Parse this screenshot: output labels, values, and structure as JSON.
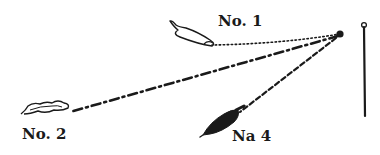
{
  "diagram": {
    "type": "hand-drawn illustration",
    "colors": {
      "ink": "#1a1a1a",
      "background": "#ffffff"
    },
    "anchor": {
      "name": "point",
      "x": 340,
      "y": 34
    },
    "post": {
      "name": "vertical-post",
      "x": 364,
      "top": 22,
      "bottom": 116
    },
    "objects": [
      {
        "id": "no1",
        "label": "No. 1",
        "line_style": "dotted",
        "fill": "outline",
        "label_pos": {
          "x": 218,
          "y": 24
        }
      },
      {
        "id": "no2",
        "label": "No. 2",
        "line_style": "dash-dot",
        "fill": "outline",
        "label_pos": {
          "x": 22,
          "y": 142
        }
      },
      {
        "id": "no4",
        "label": "No. 4",
        "display_label": "Na 4",
        "line_style": "dashed",
        "fill": "solid",
        "label_pos": {
          "x": 232,
          "y": 143
        }
      }
    ]
  }
}
